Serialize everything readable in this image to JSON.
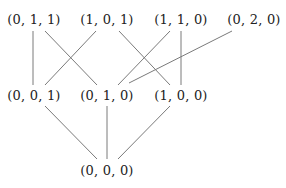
{
  "diagram": {
    "type": "hasse-diagram",
    "nodes": [
      {
        "id": "n011",
        "label": "(0, 1, 1)",
        "x": 34,
        "y": 19
      },
      {
        "id": "n101",
        "label": "(1, 0, 1)",
        "x": 107,
        "y": 19
      },
      {
        "id": "n110",
        "label": "(1, 1, 0)",
        "x": 181,
        "y": 19
      },
      {
        "id": "n020",
        "label": "(0, 2, 0)",
        "x": 254,
        "y": 19
      },
      {
        "id": "n001",
        "label": "(0, 0, 1)",
        "x": 34,
        "y": 95
      },
      {
        "id": "n010",
        "label": "(0, 1, 0)",
        "x": 107,
        "y": 95
      },
      {
        "id": "n100",
        "label": "(1, 0, 0)",
        "x": 181,
        "y": 95
      },
      {
        "id": "n000",
        "label": "(0, 0, 0)",
        "x": 107,
        "y": 170
      }
    ],
    "edges": [
      {
        "from": "n011",
        "to": "n001",
        "x1": 33,
        "y1": 31,
        "x2": 33,
        "y2": 85
      },
      {
        "from": "n011",
        "to": "n010",
        "x1": 45,
        "y1": 31,
        "x2": 97,
        "y2": 85
      },
      {
        "from": "n101",
        "to": "n001",
        "x1": 96,
        "y1": 31,
        "x2": 45,
        "y2": 85
      },
      {
        "from": "n101",
        "to": "n100",
        "x1": 119,
        "y1": 31,
        "x2": 170,
        "y2": 85
      },
      {
        "from": "n110",
        "to": "n010",
        "x1": 170,
        "y1": 31,
        "x2": 118,
        "y2": 85
      },
      {
        "from": "n110",
        "to": "n100",
        "x1": 181,
        "y1": 31,
        "x2": 181,
        "y2": 85
      },
      {
        "from": "n020",
        "to": "n010",
        "x1": 232,
        "y1": 31,
        "x2": 129,
        "y2": 83
      },
      {
        "from": "n001",
        "to": "n000",
        "x1": 45,
        "y1": 106,
        "x2": 97,
        "y2": 159
      },
      {
        "from": "n010",
        "to": "n000",
        "x1": 107,
        "y1": 106,
        "x2": 107,
        "y2": 159
      },
      {
        "from": "n100",
        "to": "n000",
        "x1": 170,
        "y1": 106,
        "x2": 118,
        "y2": 159
      }
    ],
    "colors": {
      "text": "#222222",
      "edge": "#7a7a7a",
      "background": "#ffffff"
    }
  }
}
